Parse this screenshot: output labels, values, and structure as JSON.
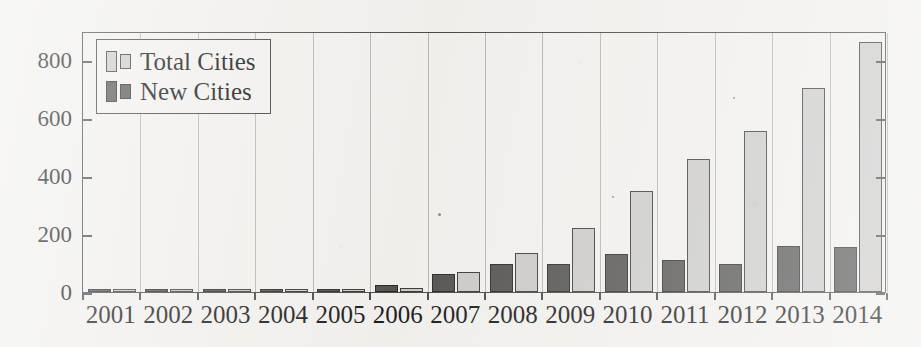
{
  "chart_data": {
    "type": "bar",
    "title": "",
    "xlabel": "",
    "ylabel": "",
    "ylim": [
      0,
      900
    ],
    "yticks": [
      0,
      200,
      400,
      600,
      800
    ],
    "ytick_labels": [
      "0",
      "200",
      "400",
      "600",
      "800"
    ],
    "grid": "vertical",
    "legend_position": "upper-left",
    "categories": [
      "2001",
      "2002",
      "2003",
      "2004",
      "2005",
      "2006",
      "2007",
      "2008",
      "2009",
      "2010",
      "2011",
      "2012",
      "2013",
      "2014"
    ],
    "series": [
      {
        "name": "Total Cities",
        "color": "#cdcccb",
        "values": [
          3,
          4,
          5,
          8,
          10,
          14,
          70,
          135,
          220,
          350,
          460,
          555,
          702,
          862
        ]
      },
      {
        "name": "New Cities",
        "color": "#565554",
        "values": [
          3,
          3,
          4,
          6,
          7,
          25,
          62,
          95,
          95,
          130,
          112,
          96,
          157,
          155
        ]
      }
    ]
  },
  "legend": {
    "entries": [
      {
        "label": "Total Cities",
        "swatch": "legend-swatch-total-cities"
      },
      {
        "label": "New Cities",
        "swatch": "legend-swatch-new-cities"
      }
    ]
  },
  "axes": {
    "y_tick_labels": [
      "800",
      "600",
      "400",
      "200",
      "0"
    ],
    "x_tick_labels": [
      "2001",
      "2002",
      "2003",
      "2004",
      "2005",
      "2006",
      "2007",
      "2008",
      "2009",
      "2010",
      "2011",
      "2012",
      "2013",
      "2014"
    ]
  },
  "colors": {
    "background": "#f2f1ee",
    "axis": "#4a4a4a",
    "gridline": "#b9b8b4",
    "total_cities": "#cdcccb",
    "new_cities": "#565554",
    "text": "#1d1d1d"
  }
}
